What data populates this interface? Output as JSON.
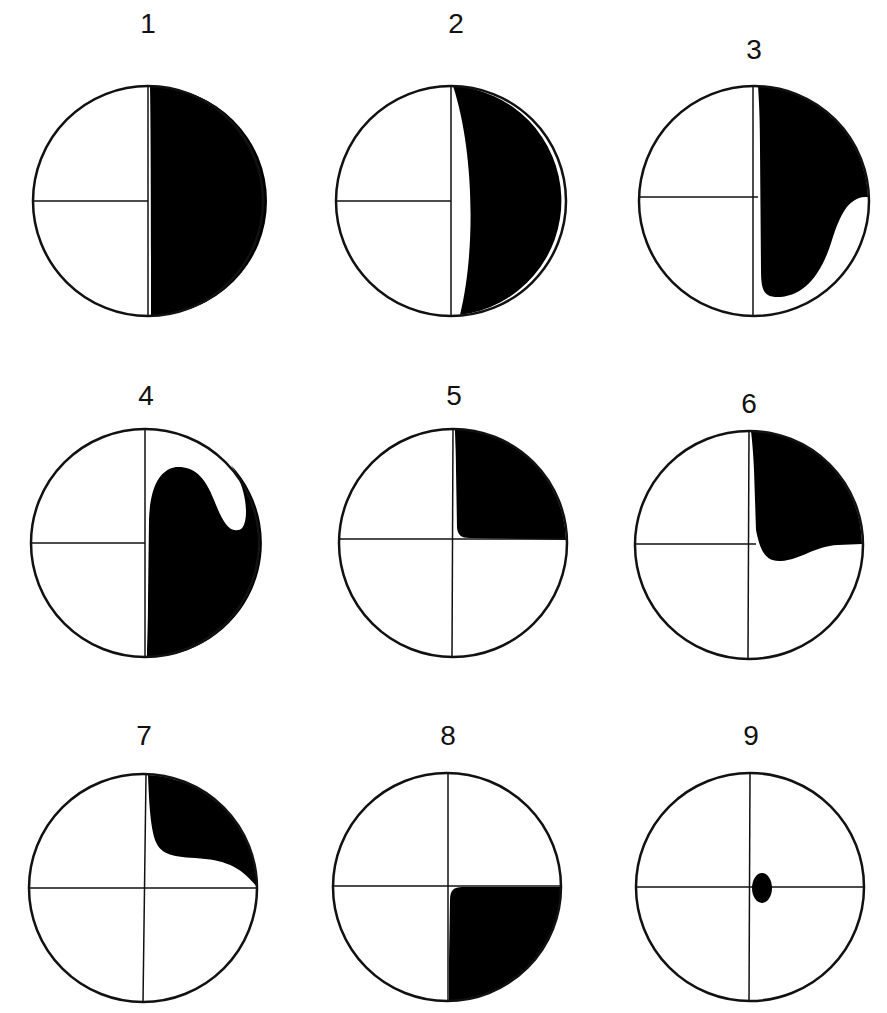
{
  "figure": {
    "panels": [
      {
        "label": "1",
        "cx": 148,
        "cy": 201,
        "r": 115,
        "shape": "Right half shaded black, with a thin white sliver along the vertical axis"
      },
      {
        "label": "2",
        "cx": 451,
        "cy": 201,
        "r": 115,
        "shape": "Right crescent shaded black, with a lens-shaped white gap bulging right of the vertical axis"
      },
      {
        "label": "3",
        "cx": 754,
        "cy": 201,
        "r": 115,
        "shape": "Upper-right quadrant and most of lower-right shaded, with a white notch cutting in from the right edge below the horizontal axis"
      },
      {
        "label": "4",
        "cx": 145,
        "cy": 543,
        "r": 114,
        "shape": "Lower-right and part of upper-right shaded, with a white hook-shaped region near the upper-right rim"
      },
      {
        "label": "5",
        "cx": 453,
        "cy": 543,
        "r": 114,
        "shape": "Upper-right quadrant shaded, with a rounded inner corner near the center"
      },
      {
        "label": "6",
        "cx": 750,
        "cy": 543,
        "r": 114,
        "shape": "Upper-right quadrant shaded, with a lobe dipping slightly below the horizontal axis"
      },
      {
        "label": "7",
        "cx": 143,
        "cy": 887,
        "r": 114,
        "shape": "Upper-right sliver shaded, tapering to a point at the right end of the horizontal axis"
      },
      {
        "label": "8",
        "cx": 447,
        "cy": 887,
        "r": 114,
        "shape": "Lower-right quadrant shaded"
      },
      {
        "label": "9",
        "cx": 750,
        "cy": 887,
        "r": 114,
        "shape": "Small black ellipse just right of center, slightly below the horizontal axis"
      }
    ],
    "colors": {
      "fill": "#000000",
      "stroke": "#111111",
      "background": "#ffffff"
    }
  }
}
